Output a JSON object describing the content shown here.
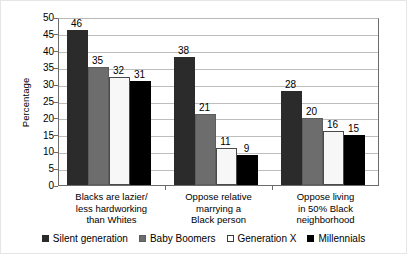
{
  "chart_data": {
    "type": "bar",
    "title": "",
    "xlabel": "",
    "ylabel": "Percentage",
    "ylim": [
      0,
      50
    ],
    "ytick_step": 5,
    "yticks": [
      50,
      45,
      40,
      35,
      30,
      25,
      20,
      15,
      10,
      5,
      0
    ],
    "grid": true,
    "legend_position": "bottom",
    "categories": [
      "Blacks are lazier/\nless hardworking\nthan Whites",
      "Oppose relative\nmarrying a\nBlack person",
      "Oppose living\nin 50% Black\nneighborhood"
    ],
    "series": [
      {
        "name": "Silent generation",
        "color": "#2b2b2b",
        "values": [
          46,
          38,
          28
        ]
      },
      {
        "name": "Baby Boomers",
        "color": "#6d6d6d",
        "values": [
          35,
          21,
          20
        ]
      },
      {
        "name": "Generation X",
        "color": "#f7f7f7",
        "values": [
          32,
          11,
          16
        ]
      },
      {
        "name": "Millennials",
        "color": "#000000",
        "values": [
          31,
          9,
          15
        ]
      }
    ]
  }
}
